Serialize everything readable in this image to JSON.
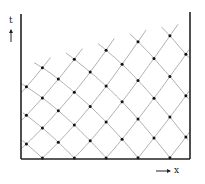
{
  "labels": {
    "t_axis": "t",
    "x_axis": "x"
  },
  "colors": {
    "wall": "#222222",
    "mesh": "#9a9a9a",
    "node": "#111111",
    "background": "#ffffff"
  },
  "geometry": {
    "left_wall": {
      "x": 21,
      "y_top": 14,
      "y_bottom": 159
    },
    "right_wall": {
      "x": 190,
      "y_top": 12,
      "y_bottom": 159
    },
    "bottom": {
      "y": 159,
      "x_left": 21,
      "x_right": 190
    },
    "top_curve": [
      [
        21,
        67
      ],
      [
        52,
        57
      ],
      [
        81,
        49
      ],
      [
        103,
        42
      ],
      [
        122,
        36
      ],
      [
        137,
        32
      ],
      [
        150,
        29
      ],
      [
        162,
        27
      ],
      [
        172,
        25
      ],
      [
        180,
        24
      ],
      [
        186,
        23
      ],
      [
        190,
        22
      ]
    ],
    "bottom_nodes_x": [
      22,
      54,
      88,
      122,
      158,
      190
    ],
    "left_wall_nodes_y": [
      159,
      127,
      106,
      84,
      67
    ],
    "right_wall_nodes_y": [
      142,
      123,
      103,
      83,
      63,
      47,
      37,
      30,
      26,
      22
    ],
    "grid_u": 10,
    "grid_v": 10
  },
  "arrows": {
    "t_arrow": {
      "x": 11,
      "y1": 42,
      "y2": 30
    },
    "x_arrow": {
      "y": 171,
      "x1": 156,
      "x2": 170
    }
  }
}
